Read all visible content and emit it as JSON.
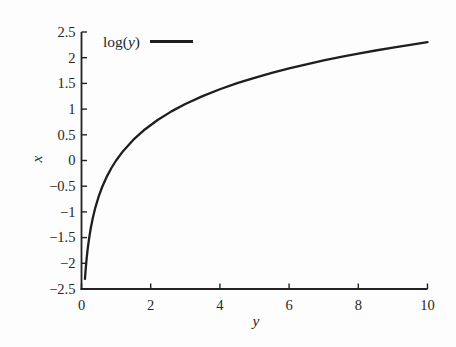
{
  "figure": {
    "background": "#fdfdfd",
    "line_color": "#1e1e1e",
    "axis_color": "#222222",
    "text_color": "#272727"
  },
  "legend": {
    "label": "log(y)",
    "label_parts": [
      {
        "text": "log(",
        "italic": false
      },
      {
        "text": "y",
        "italic": true
      },
      {
        "text": ")",
        "italic": false
      }
    ],
    "position": "top-left-inside",
    "swatch": "solid-line"
  },
  "chart_data": {
    "type": "line",
    "title": "",
    "xlabel": "y",
    "ylabel": "x",
    "xlim": [
      0,
      10
    ],
    "ylim": [
      -2.5,
      2.5
    ],
    "grid": false,
    "border": "left-bottom-only",
    "x_ticks": {
      "values": [
        0,
        2,
        4,
        6,
        8,
        10
      ],
      "labels": [
        "0",
        "2",
        "4",
        "6",
        "8",
        "10"
      ]
    },
    "y_ticks": {
      "values": [
        -2.5,
        -2,
        -1.5,
        -1,
        -0.5,
        0,
        0.5,
        1,
        1.5,
        2,
        2.5
      ],
      "labels": [
        "−2.5",
        "−2",
        "−1.5",
        "−1",
        "−0.5",
        "0",
        "0.5",
        "1",
        "1.5",
        "2",
        "2.5"
      ]
    },
    "series": [
      {
        "name": "log(y)",
        "x": [
          0.1,
          0.12,
          0.15,
          0.18,
          0.22,
          0.27,
          0.33,
          0.4,
          0.5,
          0.6,
          0.72,
          0.86,
          1.0,
          1.2,
          1.5,
          1.8,
          2.2,
          2.6,
          3.0,
          3.5,
          4.0,
          4.5,
          5.0,
          5.5,
          6.0,
          6.5,
          7.0,
          7.5,
          8.0,
          8.5,
          9.0,
          9.5,
          10.0
        ],
        "y": [
          -2.303,
          -2.12,
          -1.897,
          -1.715,
          -1.514,
          -1.309,
          -1.109,
          -0.916,
          -0.693,
          -0.511,
          -0.329,
          -0.151,
          0.0,
          0.182,
          0.405,
          0.588,
          0.788,
          0.956,
          1.099,
          1.253,
          1.386,
          1.504,
          1.609,
          1.705,
          1.792,
          1.872,
          1.946,
          2.015,
          2.079,
          2.14,
          2.197,
          2.251,
          2.303
        ]
      }
    ]
  }
}
